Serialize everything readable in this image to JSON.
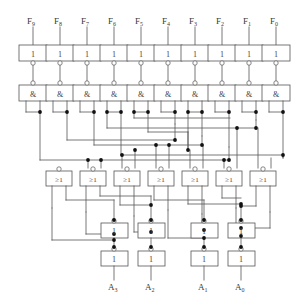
{
  "diagram": {
    "type": "logic-circuit",
    "background_color": "#ffffff",
    "line_color": "#555555",
    "box_fill": "#ffffff",
    "text_color": "#3a3a3a"
  },
  "inputs": {
    "label_base": "F",
    "items": [
      {
        "name": "F9",
        "base": "F",
        "index": "9",
        "x": 33
      },
      {
        "name": "F8",
        "base": "F",
        "index": "8",
        "x": 60
      },
      {
        "name": "F7",
        "base": "F",
        "index": "7",
        "x": 87
      },
      {
        "name": "F6",
        "base": "F",
        "index": "6",
        "x": 114
      },
      {
        "name": "F5",
        "base": "F",
        "index": "5",
        "x": 141
      },
      {
        "name": "F4",
        "base": "F",
        "index": "4",
        "x": 168
      },
      {
        "name": "F3",
        "base": "F",
        "index": "3",
        "x": 195
      },
      {
        "name": "F2",
        "base": "F",
        "index": "2",
        "x": 222
      },
      {
        "name": "F1",
        "base": "F",
        "index": "1",
        "x": 249
      },
      {
        "name": "F0",
        "base": "F",
        "index": "0",
        "x": 276
      }
    ]
  },
  "outputs": {
    "label_base": "A",
    "items": [
      {
        "name": "A3",
        "base": "A",
        "index": "3",
        "x": 114
      },
      {
        "name": "A2",
        "base": "A",
        "index": "2",
        "x": 151
      },
      {
        "name": "A1",
        "base": "A",
        "index": "1",
        "x": 204
      },
      {
        "name": "A0",
        "base": "A",
        "index": "0",
        "x": 241
      }
    ]
  },
  "gates": {
    "buffer_symbol": "1",
    "and_symbol": "&",
    "or_symbol": "≥1",
    "rows": [
      {
        "name": "input-buffer-row",
        "symbol": "1",
        "count": 10,
        "y": 45,
        "inverted_output": true
      },
      {
        "name": "and-row",
        "symbol": "&",
        "count": 10,
        "y": 85,
        "inverted_input": true
      },
      {
        "name": "or-row",
        "symbol": "≥1",
        "count": 7,
        "y": 171,
        "inverted_input": true
      },
      {
        "name": "mid-buffer-row",
        "symbol": "1",
        "count": 4,
        "y": 223,
        "inverted_input": true
      },
      {
        "name": "output-buffer-row",
        "symbol": "1",
        "count": 4,
        "y": 251,
        "inverted_input": true
      }
    ]
  },
  "legend": {
    "buffer_name": "buffer-gate",
    "and_name": "and-gate",
    "or_name": "or-gate",
    "bubble_name": "inversion-bubble",
    "junction_name": "wire-junction"
  }
}
